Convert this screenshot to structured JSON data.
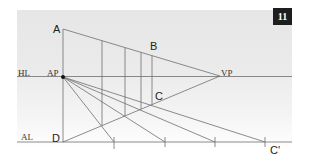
{
  "figure": {
    "badge_number": "11",
    "labels": {
      "A": "A",
      "B": "B",
      "C": "C",
      "D": "D",
      "C_prime": "C'",
      "horizon_line": "HL",
      "anchor_point": "AP",
      "vanishing_point": "VP",
      "axis_line": "AL"
    },
    "colors": {
      "line": "#6e6e6e",
      "badge_bg": "#1e1e1e",
      "badge_text": "#ffffff",
      "point": "#111111"
    }
  }
}
